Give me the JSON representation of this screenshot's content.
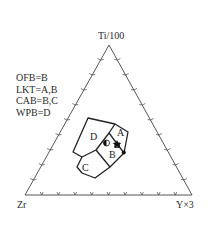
{
  "diagram": {
    "type": "ternary discrimination diagram",
    "vertices": {
      "top": "Ti/100",
      "left": "Zr",
      "right": "Y×3"
    },
    "legend": [
      "OFB=B",
      "LKT=A,B",
      "CAB=B,C",
      "WPB=D"
    ],
    "fields": [
      {
        "label": "A"
      },
      {
        "label": "B"
      },
      {
        "label": "C"
      },
      {
        "label": "D"
      }
    ],
    "ticks_per_edge": 9,
    "samples": [
      {
        "symbol": "half-filled-circle",
        "field": "D/B boundary"
      },
      {
        "symbol": "filled-star",
        "field": "A/B boundary"
      },
      {
        "symbol": "open-square",
        "field": "A/B boundary"
      },
      {
        "symbol": "filled-circle",
        "field": "A/B edge"
      }
    ],
    "colors": {
      "line": "#333333",
      "background": "#ffffff"
    }
  }
}
